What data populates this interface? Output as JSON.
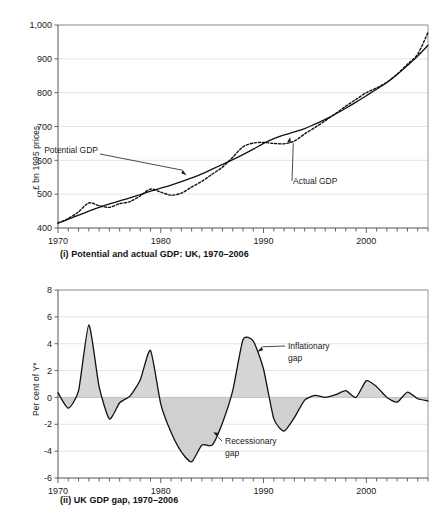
{
  "figure": {
    "background": "#ffffff",
    "text_color": "#1a1a1a",
    "series_color": "#111111",
    "gap_fill_color": "#d6d6d6",
    "grid_color": "#d9d9d9"
  },
  "panel_i": {
    "caption": "(i) Potential and actual GDP: UK, 1970–2006",
    "ylabel": "£ bn 1995 prices",
    "yticks": [
      "400",
      "500",
      "600",
      "700",
      "800",
      "900",
      "1,000"
    ],
    "xticks": [
      "1970",
      "1980",
      "1990",
      "2000"
    ],
    "annotations": [
      {
        "label": "Potential GDP",
        "target_year": 1982.5,
        "target_value": 556
      },
      {
        "label": "Actual GDP",
        "target_year": 1992.6,
        "target_value": 668
      }
    ]
  },
  "panel_ii": {
    "caption": "(ii) UK GDP gap, 1970–2006",
    "ylabel": "Per cent of Y*",
    "yticks": [
      "-6",
      "-4",
      "-2",
      "0",
      "2",
      "4",
      "6",
      "8"
    ],
    "xticks": [
      "1970",
      "1980",
      "1990",
      "2000"
    ],
    "annotations": [
      {
        "label_line1": "Inflationary",
        "label_line2": "gap",
        "target_year": 1989.4,
        "target_value": 3.4
      },
      {
        "label_line1": "Recessionary",
        "label_line2": "gap",
        "target_year": 1985.1,
        "target_value": -2.6
      }
    ]
  },
  "chart_data": [
    {
      "id": "panel-i",
      "type": "line",
      "title": "(i) Potential and actual GDP: UK, 1970–2006",
      "xlabel": "",
      "ylabel": "£ bn 1995 prices",
      "xlim": [
        1970,
        2006
      ],
      "ylim": [
        400,
        1000
      ],
      "ytick_values": [
        400,
        500,
        600,
        700,
        800,
        900,
        1000
      ],
      "ytick_labels": [
        "400",
        "500",
        "600",
        "700",
        "800",
        "900",
        "1,000"
      ],
      "xtick_values": [
        1970,
        1980,
        1990,
        2000
      ],
      "xtick_labels": [
        "1970",
        "1980",
        "1990",
        "2000"
      ],
      "minor_xtick_interval": 1,
      "grid": "horizontal",
      "legend": "none",
      "x": [
        1970,
        1971,
        1972,
        1973,
        1974,
        1975,
        1976,
        1977,
        1978,
        1979,
        1980,
        1981,
        1982,
        1983,
        1984,
        1985,
        1986,
        1987,
        1988,
        1989,
        1990,
        1991,
        1992,
        1993,
        1994,
        1995,
        1996,
        1997,
        1998,
        1999,
        2000,
        2001,
        2002,
        2003,
        2004,
        2005,
        2006
      ],
      "series": [
        {
          "name": "Potential GDP",
          "style": "solid",
          "values": [
            414,
            426,
            438,
            450,
            461,
            471,
            480,
            489,
            499,
            509,
            518,
            527,
            537,
            548,
            560,
            574,
            588,
            602,
            617,
            633,
            650,
            664,
            675,
            684,
            694,
            707,
            721,
            737,
            754,
            772,
            791,
            810,
            830,
            854,
            880,
            908,
            940
          ]
        },
        {
          "name": "Actual GDP",
          "style": "dashed",
          "values": [
            415,
            428,
            448,
            474,
            466,
            461,
            472,
            478,
            495,
            515,
            506,
            497,
            503,
            521,
            538,
            559,
            580,
            609,
            640,
            651,
            653,
            650,
            649,
            657,
            678,
            697,
            717,
            738,
            760,
            780,
            800,
            814,
            831,
            855,
            884,
            914,
            978
          ]
        }
      ]
    },
    {
      "id": "panel-ii",
      "type": "area",
      "title": "(ii) UK GDP gap, 1970–2006",
      "xlabel": "",
      "ylabel": "Per cent of Y*",
      "xlim": [
        1970,
        2006
      ],
      "ylim": [
        -6,
        8
      ],
      "ytick_values": [
        -6,
        -4,
        -2,
        0,
        2,
        4,
        6,
        8
      ],
      "ytick_labels": [
        "-6",
        "-4",
        "-2",
        "0",
        "2",
        "4",
        "6",
        "8"
      ],
      "xtick_values": [
        1970,
        1980,
        1990,
        2000
      ],
      "xtick_labels": [
        "1970",
        "1980",
        "1990",
        "2000"
      ],
      "minor_xtick_interval": 1,
      "grid": "horizontal",
      "zero_reference": 0,
      "legend": "none",
      "x": [
        1970,
        1971,
        1972,
        1973,
        1974,
        1975,
        1976,
        1977,
        1978,
        1979,
        1980,
        1981,
        1982,
        1983,
        1984,
        1985,
        1986,
        1987,
        1988,
        1989,
        1990,
        1991,
        1992,
        1993,
        1994,
        1995,
        1996,
        1997,
        1998,
        1999,
        2000,
        2001,
        2002,
        2003,
        2004,
        2005,
        2006
      ],
      "series": [
        {
          "name": "GDP gap",
          "values": [
            0.35,
            -0.8,
            0.5,
            5.4,
            0.8,
            -1.6,
            -0.4,
            0.1,
            1.3,
            3.5,
            -0.5,
            -2.6,
            -4.05,
            -4.8,
            -3.55,
            -3.55,
            -1.9,
            0.5,
            4.3,
            4.2,
            2.1,
            -1.6,
            -2.5,
            -1.5,
            -0.2,
            0.15,
            0.0,
            0.2,
            0.5,
            0.0,
            1.25,
            0.8,
            0.0,
            -0.35,
            0.4,
            -0.1,
            -0.25
          ]
        }
      ]
    }
  ]
}
